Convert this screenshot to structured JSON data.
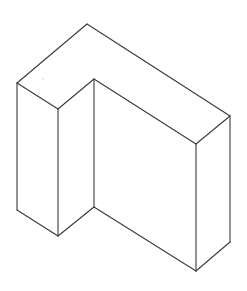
{
  "diagram": {
    "type": "isometric-line-drawing",
    "background_color": "#ffffff",
    "line_color": "#3a3a3a",
    "vertices": {
      "top_apex": [
        87,
        24
      ],
      "left_top": [
        17,
        83
      ],
      "inner_front_top": [
        58,
        109
      ],
      "notch_top": [
        94,
        79
      ],
      "right_back_top": [
        230,
        116
      ],
      "front_right_top": [
        196,
        144
      ],
      "left_bottom": [
        17,
        210
      ],
      "inner_front_bottom": [
        58,
        236
      ],
      "notch_bottom": [
        94,
        207
      ],
      "front_right_bottom": [
        196,
        271
      ],
      "right_back_bottom": [
        230,
        242
      ]
    },
    "faces": [
      "top-L-face",
      "left-front-face",
      "left-side-face",
      "inner-notch-face",
      "main-front-face",
      "right-side-face"
    ]
  }
}
